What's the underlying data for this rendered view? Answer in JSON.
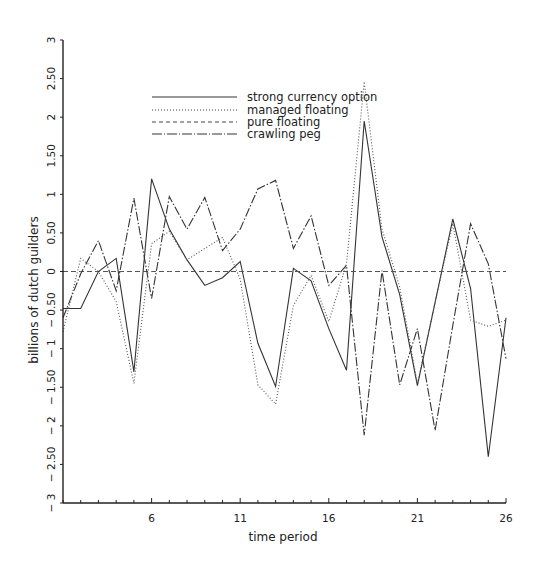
{
  "chart_data": {
    "type": "line",
    "title": "",
    "xlabel": "time period",
    "ylabel": "billions of dutch guilders",
    "x": [
      1,
      2,
      3,
      4,
      5,
      6,
      7,
      8,
      9,
      10,
      11,
      12,
      13,
      14,
      15,
      16,
      17,
      18,
      19,
      20,
      21,
      22,
      23,
      24,
      25,
      26
    ],
    "xlim": [
      1,
      26
    ],
    "ylim": [
      -3,
      3
    ],
    "x_ticks": [
      6,
      11,
      16,
      21,
      26
    ],
    "x_tick_labels": [
      "6",
      "11",
      "16",
      "21",
      "26"
    ],
    "y_ticks": [
      -3,
      -2.5,
      -2,
      -1.5,
      -1,
      -0.5,
      0,
      0.5,
      1,
      1.5,
      2,
      2.5,
      3
    ],
    "y_tick_labels": [
      "− 3",
      "− 2.50",
      "− 2",
      "− 1.50",
      "− 1",
      "− 0.50",
      "0",
      "0.50",
      "1",
      "1.50",
      "2",
      "2.50",
      "3"
    ],
    "grid": false,
    "legend_position": "upper center",
    "series": [
      {
        "name": "strong currency option",
        "style": "solid",
        "values": [
          -0.48,
          -0.48,
          0.0,
          0.17,
          -1.3,
          1.2,
          0.55,
          0.15,
          -0.18,
          -0.08,
          0.13,
          -0.93,
          -1.49,
          0.04,
          -0.12,
          -0.74,
          -1.28,
          1.95,
          0.45,
          -0.3,
          -1.48,
          -0.4,
          0.68,
          -0.22,
          -2.4,
          -0.6
        ]
      },
      {
        "name": "managed floating",
        "style": "dotted",
        "values": [
          -0.78,
          0.17,
          0.0,
          -0.39,
          -1.45,
          0.36,
          0.52,
          0.15,
          0.3,
          0.44,
          -0.1,
          -1.47,
          -1.72,
          -0.44,
          -0.05,
          -0.65,
          0.1,
          2.46,
          0.55,
          -0.2,
          -1.45,
          -0.4,
          0.62,
          -0.63,
          -0.71,
          -0.63
        ]
      },
      {
        "name": "pure floating",
        "style": "dashed",
        "values": [
          0,
          0,
          0,
          0,
          0,
          0,
          0,
          0,
          0,
          0,
          0,
          0,
          0,
          0,
          0,
          0,
          0,
          0,
          0,
          0,
          0,
          0,
          0,
          0,
          0,
          0
        ]
      },
      {
        "name": "crawling peg",
        "style": "dashdot",
        "values": [
          -0.6,
          -0.03,
          0.4,
          -0.25,
          0.95,
          -0.35,
          0.97,
          0.55,
          0.96,
          0.27,
          0.55,
          1.07,
          1.18,
          0.3,
          0.72,
          -0.18,
          0.08,
          -2.12,
          0.01,
          -1.47,
          -0.74,
          -2.06,
          -0.7,
          0.62,
          0.1,
          -1.13
        ]
      }
    ]
  },
  "legend": {
    "items": [
      {
        "label": "strong currency option"
      },
      {
        "label": "managed floating"
      },
      {
        "label": "pure floating"
      },
      {
        "label": "crawling peg"
      }
    ]
  },
  "axes": {
    "xlabel": "time period",
    "ylabel": "billions of dutch guilders"
  }
}
